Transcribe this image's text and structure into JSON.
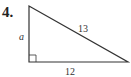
{
  "problem": {
    "number": "4.",
    "figure": "right-triangle",
    "sides": {
      "vertical_leg": "a",
      "hypotenuse": "13",
      "horizontal_leg": "12"
    },
    "right_angle_marker": true
  }
}
